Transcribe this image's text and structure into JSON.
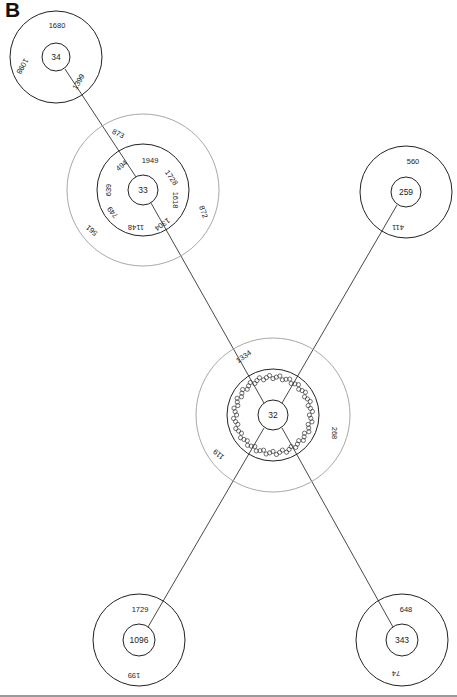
{
  "panel_label": "B",
  "colors": {
    "black_ring": "#222222",
    "gray_ring": "#a8a8a8",
    "edge": "#333333",
    "bottom_rule": "#9a9a9a"
  },
  "nodes": [
    {
      "id": "34",
      "center_label": "34",
      "cx": 56,
      "cy": 57,
      "rings": [
        {
          "r": 14,
          "color": "black"
        },
        {
          "r": 46,
          "color": "black"
        }
      ],
      "labels": [
        {
          "text": "1680",
          "x": 57,
          "y": 26,
          "rot": 0
        },
        {
          "text": "1098",
          "x": 22,
          "y": 66,
          "rot": 120
        },
        {
          "text": "1399",
          "x": 79,
          "y": 82,
          "rot": -60
        }
      ]
    },
    {
      "id": "33",
      "center_label": "33",
      "cx": 143,
      "cy": 190,
      "rings": [
        {
          "r": 15,
          "color": "black"
        },
        {
          "r": 46,
          "color": "black"
        },
        {
          "r": 76,
          "color": "gray"
        }
      ],
      "labels": [
        {
          "text": "873",
          "x": 118,
          "y": 134,
          "rot": 25
        },
        {
          "text": "494",
          "x": 122,
          "y": 166,
          "rot": -40
        },
        {
          "text": "1949",
          "x": 150,
          "y": 161,
          "rot": 0
        },
        {
          "text": "1728",
          "x": 171,
          "y": 178,
          "rot": 55
        },
        {
          "text": "1618",
          "x": 175,
          "y": 200,
          "rot": 90
        },
        {
          "text": "1304",
          "x": 162,
          "y": 224,
          "rot": 145
        },
        {
          "text": "1148",
          "x": 136,
          "y": 227,
          "rot": 180
        },
        {
          "text": "749",
          "x": 113,
          "y": 212,
          "rot": 230
        },
        {
          "text": "639",
          "x": 109,
          "y": 190,
          "rot": 270
        },
        {
          "text": "872",
          "x": 203,
          "y": 212,
          "rot": 70
        },
        {
          "text": "561",
          "x": 92,
          "y": 230,
          "rot": 220
        }
      ]
    },
    {
      "id": "259",
      "center_label": "259",
      "cx": 406,
      "cy": 192,
      "rings": [
        {
          "r": 15,
          "color": "black"
        },
        {
          "r": 46,
          "color": "black"
        }
      ],
      "labels": [
        {
          "text": "560",
          "x": 413,
          "y": 162,
          "rot": 0
        },
        {
          "text": "411",
          "x": 398,
          "y": 227,
          "rot": 180
        }
      ]
    },
    {
      "id": "32",
      "center_label": "32",
      "cx": 273,
      "cy": 415,
      "rings": [
        {
          "r": 15,
          "color": "black"
        },
        {
          "r": 46,
          "color": "black"
        },
        {
          "r": 77,
          "color": "gray"
        }
      ],
      "dense_ring": {
        "r": 38,
        "count": 72
      },
      "labels": [
        {
          "text": "1334",
          "x": 244,
          "y": 357,
          "rot": -35
        },
        {
          "text": "268",
          "x": 334,
          "y": 433,
          "rot": 90
        },
        {
          "text": "119",
          "x": 219,
          "y": 454,
          "rot": 220
        }
      ]
    },
    {
      "id": "1096",
      "center_label": "1096",
      "cx": 139,
      "cy": 640,
      "rings": [
        {
          "r": 16,
          "color": "black"
        },
        {
          "r": 46,
          "color": "black"
        }
      ],
      "labels": [
        {
          "text": "1729",
          "x": 140,
          "y": 610,
          "rot": 0
        },
        {
          "text": "199",
          "x": 134,
          "y": 675,
          "rot": 180
        }
      ]
    },
    {
      "id": "343",
      "center_label": "343",
      "cx": 402,
      "cy": 640,
      "rings": [
        {
          "r": 16,
          "color": "black"
        },
        {
          "r": 46,
          "color": "black"
        }
      ],
      "labels": [
        {
          "text": "648",
          "x": 406,
          "y": 610,
          "rot": 0
        },
        {
          "text": "74",
          "x": 396,
          "y": 673,
          "rot": 180
        }
      ]
    }
  ],
  "edges": [
    {
      "from": "34",
      "to": "33",
      "x1": 65,
      "y1": 69,
      "x2": 136,
      "y2": 177
    },
    {
      "from": "33",
      "to": "32",
      "x1": 151,
      "y1": 203,
      "x2": 264,
      "y2": 403
    },
    {
      "from": "259",
      "to": "32",
      "x1": 397,
      "y1": 205,
      "x2": 282,
      "y2": 403
    },
    {
      "from": "32",
      "to": "1096",
      "x1": 264,
      "y1": 428,
      "x2": 148,
      "y2": 627
    },
    {
      "from": "32",
      "to": "343",
      "x1": 282,
      "y1": 428,
      "x2": 393,
      "y2": 627
    }
  ]
}
